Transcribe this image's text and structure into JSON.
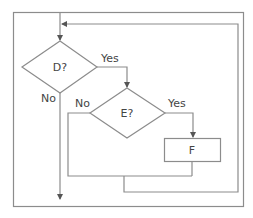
{
  "diagram": {
    "type": "flowchart",
    "nodes": {
      "d": {
        "label": "D?",
        "shape": "diamond"
      },
      "e": {
        "label": "E?",
        "shape": "diamond"
      },
      "f": {
        "label": "F",
        "shape": "rectangle"
      }
    },
    "edge_labels": {
      "d_yes": "Yes",
      "d_no": "No",
      "e_yes": "Yes",
      "e_no": "No"
    },
    "colors": {
      "stroke": "#8c8c8c",
      "text": "#444444",
      "background": "#ffffff"
    }
  }
}
